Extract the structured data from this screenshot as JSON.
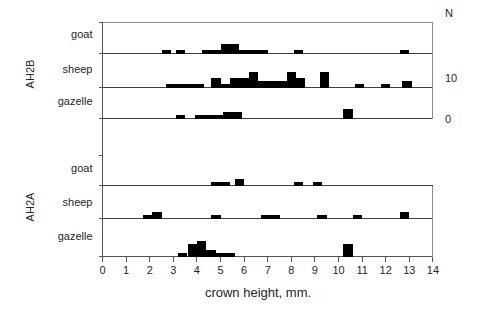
{
  "chart_data": {
    "type": "bar",
    "title": "",
    "xlabel": "crown height, mm.",
    "ylabel": "N",
    "xlim": [
      0,
      14
    ],
    "ylim": [
      0,
      10
    ],
    "xticks": [
      0,
      1,
      2,
      3,
      4,
      5,
      6,
      7,
      8,
      9,
      10,
      11,
      12,
      13,
      14
    ],
    "xticklabels": [
      "0",
      "1",
      "2",
      "3",
      "4",
      "5",
      "6",
      "7",
      "8",
      "9",
      "10",
      "11",
      "12",
      "13",
      "14"
    ],
    "yticklabels": [
      "N",
      "10",
      "0"
    ],
    "grid": false,
    "legend_position": "none",
    "bin_width": 0.4,
    "groups": [
      {
        "name": "AH2B",
        "rows": [
          {
            "taxon": "goat",
            "bins": [
              {
                "x": 2.5,
                "n": 1
              },
              {
                "x": 3.1,
                "n": 1
              },
              {
                "x": 4.2,
                "n": 1
              },
              {
                "x": 4.6,
                "n": 1
              },
              {
                "x": 5.0,
                "n": 3
              },
              {
                "x": 5.4,
                "n": 3
              },
              {
                "x": 5.8,
                "n": 1
              },
              {
                "x": 6.2,
                "n": 1
              },
              {
                "x": 6.6,
                "n": 1
              },
              {
                "x": 8.1,
                "n": 1
              },
              {
                "x": 12.6,
                "n": 1
              }
            ]
          },
          {
            "taxon": "sheep",
            "bins": [
              {
                "x": 2.7,
                "n": 1
              },
              {
                "x": 3.1,
                "n": 1
              },
              {
                "x": 3.5,
                "n": 1
              },
              {
                "x": 3.9,
                "n": 1
              },
              {
                "x": 4.6,
                "n": 3
              },
              {
                "x": 5.0,
                "n": 1
              },
              {
                "x": 5.4,
                "n": 3
              },
              {
                "x": 5.8,
                "n": 3
              },
              {
                "x": 6.2,
                "n": 5
              },
              {
                "x": 6.6,
                "n": 2
              },
              {
                "x": 7.0,
                "n": 2
              },
              {
                "x": 7.4,
                "n": 2
              },
              {
                "x": 7.8,
                "n": 5
              },
              {
                "x": 8.2,
                "n": 3
              },
              {
                "x": 9.2,
                "n": 5
              },
              {
                "x": 10.7,
                "n": 1
              },
              {
                "x": 11.8,
                "n": 1
              },
              {
                "x": 12.7,
                "n": 2
              }
            ]
          },
          {
            "taxon": "gazelle",
            "bins": [
              {
                "x": 3.1,
                "n": 1
              },
              {
                "x": 3.9,
                "n": 1
              },
              {
                "x": 4.3,
                "n": 1
              },
              {
                "x": 4.7,
                "n": 1
              },
              {
                "x": 5.1,
                "n": 2
              },
              {
                "x": 5.5,
                "n": 2
              },
              {
                "x": 10.2,
                "n": 3
              }
            ]
          }
        ]
      },
      {
        "name": "AH2A",
        "rows": [
          {
            "taxon": "goat",
            "bins": [
              {
                "x": 4.6,
                "n": 1
              },
              {
                "x": 5.0,
                "n": 1
              },
              {
                "x": 5.6,
                "n": 2
              },
              {
                "x": 8.1,
                "n": 1
              },
              {
                "x": 8.9,
                "n": 1
              }
            ]
          },
          {
            "taxon": "sheep",
            "bins": [
              {
                "x": 1.7,
                "n": 1
              },
              {
                "x": 2.1,
                "n": 2
              },
              {
                "x": 4.6,
                "n": 1
              },
              {
                "x": 6.7,
                "n": 1
              },
              {
                "x": 7.1,
                "n": 1
              },
              {
                "x": 9.1,
                "n": 1
              },
              {
                "x": 10.6,
                "n": 1
              },
              {
                "x": 12.6,
                "n": 2
              }
            ]
          },
          {
            "taxon": "gazelle",
            "bins": [
              {
                "x": 3.2,
                "n": 1
              },
              {
                "x": 3.6,
                "n": 4
              },
              {
                "x": 4.0,
                "n": 5
              },
              {
                "x": 4.4,
                "n": 2
              },
              {
                "x": 4.8,
                "n": 1
              },
              {
                "x": 5.2,
                "n": 1
              },
              {
                "x": 10.2,
                "n": 4
              }
            ]
          }
        ]
      }
    ]
  },
  "axis": {
    "xlabel": "crown height, mm.",
    "n_label": "N",
    "scale_top": "10",
    "scale_bottom": "0"
  },
  "colors": {
    "bar": "#000000",
    "axis": "#555555",
    "frame": "#8c8c8c",
    "text": "#262626",
    "background": "#ffffff"
  }
}
